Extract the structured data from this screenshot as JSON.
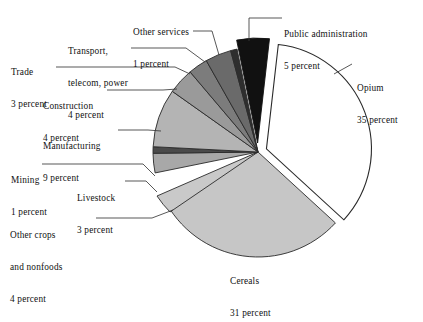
{
  "chart_data": {
    "type": "pie",
    "title": "",
    "subtitle": "",
    "xlabel": "",
    "ylabel": "",
    "legend_position": "callout-labels",
    "grid": false,
    "unit_word": "percent",
    "total": 100,
    "categories": [
      "Public administration",
      "Opium",
      "Cereals",
      "Other crops and nonfoods",
      "Livestock",
      "Mining",
      "Manufacturing",
      "Construction",
      "Trade",
      "Transport, telecom, power",
      "Other services"
    ],
    "values": [
      5,
      35,
      31,
      4,
      3,
      1,
      9,
      4,
      3,
      4,
      1
    ],
    "slices": [
      {
        "name": "Public administration",
        "value": 5,
        "color": "#111111",
        "exploded": true
      },
      {
        "name": "Opium",
        "value": 35,
        "color": "#ffffff",
        "exploded": true
      },
      {
        "name": "Cereals",
        "value": 31,
        "color": "#c6c6c6",
        "exploded": false
      },
      {
        "name": "Other crops and nonfoods",
        "value": 4,
        "color": "#c9c9c9",
        "exploded": false
      },
      {
        "name": "Livestock",
        "value": 3,
        "color": "#a8a8a8",
        "exploded": false
      },
      {
        "name": "Mining",
        "value": 1,
        "color": "#4a4a4a",
        "exploded": false
      },
      {
        "name": "Manufacturing",
        "value": 9,
        "color": "#b4b4b4",
        "exploded": false
      },
      {
        "name": "Construction",
        "value": 4,
        "color": "#9a9a9a",
        "exploded": false
      },
      {
        "name": "Trade",
        "value": 3,
        "color": "#7c7c7c",
        "exploded": false
      },
      {
        "name": "Transport, telecom, power",
        "value": 4,
        "color": "#6a6a6a",
        "exploded": false
      },
      {
        "name": "Other services",
        "value": 1,
        "color": "#2e2e2e",
        "exploded": false
      }
    ]
  },
  "labels": {
    "public_administration": {
      "name": "Public administration",
      "percent": "5 percent"
    },
    "opium": {
      "name": "Opium",
      "percent": "35 percent"
    },
    "cereals": {
      "name": "Cereals",
      "percent": "31 percent"
    },
    "other_crops": {
      "name_line1": "Other crops",
      "name_line2": "and nonfoods",
      "percent": "4 percent"
    },
    "livestock": {
      "name": "Livestock",
      "percent": "3 percent"
    },
    "mining": {
      "name": "Mining",
      "percent": "1 percent"
    },
    "manufacturing": {
      "name": "Manufacturing",
      "percent": "9 percent"
    },
    "construction": {
      "name": "Construction",
      "percent": "4 percent"
    },
    "trade": {
      "name": "Trade",
      "percent": "3 percent"
    },
    "transport": {
      "name_line1": "Transport,",
      "name_line2": "telecom, power",
      "percent": "4 percent"
    },
    "other_services": {
      "name": "Other services",
      "percent": "1 percent"
    }
  },
  "colors": {
    "background": "#ffffff",
    "outline": "#2a2a2a",
    "text": "#111111",
    "leader_line": "#3a3a3a"
  }
}
